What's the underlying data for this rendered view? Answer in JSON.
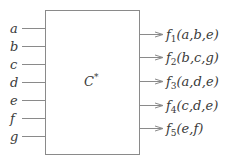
{
  "diagram": {
    "component": {
      "name": "C",
      "superscript": "*"
    },
    "inputs": [
      "a",
      "b",
      "c",
      "d",
      "e",
      "f",
      "g"
    ],
    "outputs": [
      {
        "func": "f",
        "index": "1",
        "args": "(a,b,e)"
      },
      {
        "func": "f",
        "index": "2",
        "args": "(b,c,g)"
      },
      {
        "func": "f",
        "index": "3",
        "args": "(a,d,e)"
      },
      {
        "func": "f",
        "index": "4",
        "args": "(c,d,e)"
      },
      {
        "func": "f",
        "index": "5",
        "args": "(e,f)"
      }
    ],
    "colors": {
      "stroke": "#8a8a8a",
      "text": "#3a3a3a"
    }
  }
}
